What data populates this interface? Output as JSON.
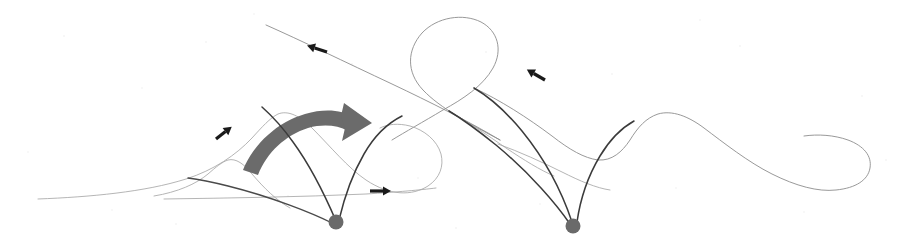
{
  "figure": {
    "domain_type": "phase-portrait-diagram",
    "width": 906,
    "height": 244,
    "background_color": "#ffffff",
    "title": "",
    "caption": ""
  },
  "palette": {
    "thin_curve": "#8d8d8d",
    "thin_curve_faint": "#a8a8a8",
    "separatrix": "#3b3b3b",
    "separatrix_soft": "#4a4a4a",
    "fixed_point": "#6a6a6a",
    "flow_arrow": "#1a1a1a",
    "transition_arrow": "#6b6b6b"
  },
  "fixed_points": [
    {
      "name": "saddle-point-left",
      "cx": 336,
      "cy": 222,
      "r": 7.5,
      "color": "#6a6a6a"
    },
    {
      "name": "saddle-point-right",
      "cx": 573,
      "cy": 226,
      "r": 7.5,
      "color": "#6a6a6a"
    }
  ],
  "separatrices": [
    {
      "name": "left-saddle-branch-upper-left",
      "d": "M 336 221 C 327 200 312 168 293 142 C 281 125 271 115 262 107"
    },
    {
      "name": "left-saddle-branch-upper-right",
      "d": "M 339 220 C 344 199 353 173 364 154 C 376 133 390 122 402 116"
    },
    {
      "name": "left-saddle-branch-lower-left",
      "d": "M 332 223 C 312 213 272 197 228 186 C 208 181 196 179 188 178"
    },
    {
      "name": "right-saddle-branch-far-left",
      "d": "M 570 224 C 557 205 531 174 496 145 C 475 128 459 117 449 111"
    },
    {
      "name": "right-saddle-branch-mid-left",
      "d": "M 572 222 C 564 198 548 163 522 131 C 503 108 486 95 474 88"
    },
    {
      "name": "right-saddle-branch-right",
      "d": "M 577 222 C 580 201 588 176 600 156 C 612 136 625 126 634 121"
    }
  ],
  "thin_curves": [
    {
      "name": "upper-left-descending-manifold",
      "d": "M 266 25 C 300 40 345 62 392 84 C 430 102 470 122 500 140"
    },
    {
      "name": "upper-right-teardrop-loop",
      "d": "M 500 140 C 470 124 440 108 423 90 C 406 72 407 50 422 33 C 437 17 463 13 481 22 C 498 31 503 50 493 68 C 483 86 463 99 443 110 C 423 122 405 132 392 140"
    },
    {
      "name": "left-hill-contour-outer",
      "d": "M 38 199 C 90 197 145 192 186 179 C 214 170 236 155 252 138 C 262 127 270 118 278 114 C 288 110 300 116 312 128 C 330 146 348 168 366 180 C 390 196 412 196 428 186 C 440 178 444 166 441 154 C 437 140 424 130 410 126 C 398 123 388 124 380 128"
    },
    {
      "name": "left-hill-contour-inner",
      "d": "M 154 196 C 178 192 196 184 208 174 C 216 167 222 162 228 160 C 236 158 244 164 252 174 C 264 188 276 200 290 208"
    },
    {
      "name": "left-baseline-contour",
      "d": "M 164 199 C 230 198 300 197 366 194 C 398 192 420 190 436 188"
    },
    {
      "name": "right-plateau-contour",
      "d": "M 474 88 C 500 100 528 118 552 136 C 570 150 584 158 598 160 C 612 161 622 152 630 140 C 638 127 646 118 658 114 C 672 110 688 116 704 128 C 724 143 748 162 772 174 C 796 186 818 192 836 190 C 856 188 868 180 870 168 C 872 156 864 146 848 140 C 834 135 818 134 804 136"
    },
    {
      "name": "right-lower-tail-contour",
      "d": "M 498 144 C 520 152 542 162 562 172 C 580 181 596 188 610 190"
    },
    {
      "name": "mid-descending-thin",
      "d": "M 449 111 C 466 121 486 134 506 148 C 524 160 540 170 554 176"
    }
  ],
  "flow_arrows": [
    {
      "name": "flow-arrow-upper-left",
      "x": 327,
      "y": 52,
      "angle": -162,
      "length": 19,
      "direction": "leftward-up-slope"
    },
    {
      "name": "flow-arrow-upper-right",
      "x": 545,
      "y": 80,
      "angle": -150,
      "length": 19,
      "direction": "leftward-down-slope"
    },
    {
      "name": "flow-arrow-left-hill",
      "x": 216,
      "y": 139,
      "angle": -38,
      "length": 18,
      "direction": "rightward-up-slope"
    },
    {
      "name": "flow-arrow-baseline",
      "x": 370,
      "y": 191,
      "angle": 0,
      "length": 20,
      "direction": "rightward-horizontal"
    }
  ],
  "transition_arrow": {
    "name": "transition-arrow-curved",
    "color": "#6b6b6b",
    "description": "thick curved arrow sweeping left-to-right over the left saddle region",
    "body_path": "M 247 163 C 256 140 278 122 302 116 C 322 111 338 114 350 122",
    "head_tip_x": 368,
    "head_tip_y": 121
  },
  "annotations": {
    "has_axes": false,
    "has_legend": false,
    "has_labels": false,
    "has_gridlines": false
  }
}
